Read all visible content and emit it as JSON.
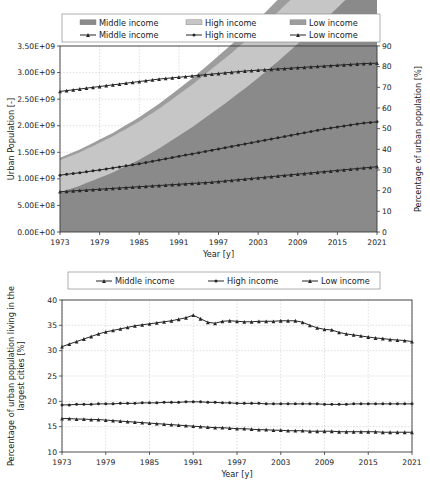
{
  "figure": {
    "width": 430,
    "height": 489,
    "background": "#ffffff"
  },
  "colors": {
    "area_middle": "#8a8a8a",
    "area_high": "#c6c6c6",
    "area_low": "#6e6e6e",
    "line": "#262626",
    "grid": "#c9c9c9",
    "axis": "#3a3a3a"
  },
  "chart_data": [
    {
      "id": "urban-population-stacked",
      "type": "area",
      "title": "",
      "xlabel": "Year [y]",
      "ylabel": "Urban Population [-]",
      "y2label": "Percentage of urban population [%]",
      "xlim": [
        1973,
        2021
      ],
      "ylim": [
        0,
        3500000000
      ],
      "y2lim": [
        0,
        90
      ],
      "grid": true,
      "legend_position": "top",
      "xticks": [
        1973,
        1979,
        1985,
        1991,
        1997,
        2003,
        2009,
        2015,
        2021
      ],
      "xtick_labels": [
        "1973",
        "1979",
        "1985",
        "1991",
        "1997",
        "2003",
        "2009",
        "2015",
        "2021"
      ],
      "yticks": [
        0,
        500000000,
        1000000000,
        1500000000,
        2000000000,
        2500000000,
        3000000000,
        3500000000
      ],
      "ytick_labels": [
        "0.00E+00",
        "5.00E+08",
        "1.00E+09",
        "1.50E+09",
        "2.00E+09",
        "2.50E+09",
        "3.00E+09",
        "3.50E+09"
      ],
      "y2ticks": [
        0,
        10,
        20,
        30,
        40,
        50,
        60,
        70,
        80,
        90
      ],
      "y2tick_labels": [
        "0",
        "10",
        "20",
        "30",
        "40",
        "50",
        "60",
        "70",
        "80",
        "90"
      ],
      "legend": [
        {
          "label": "Middle income",
          "kind": "area",
          "swatch": "#8a8a8a"
        },
        {
          "label": "High income",
          "kind": "area",
          "swatch": "#c6c6c6"
        },
        {
          "label": "Low income",
          "kind": "area",
          "swatch": "#9d9d9d"
        },
        {
          "label": "Middle income",
          "kind": "line",
          "marker": "triangle"
        },
        {
          "label": "High income",
          "kind": "line",
          "marker": "circle"
        },
        {
          "label": "Low income",
          "kind": "line",
          "marker": "triangle"
        }
      ],
      "x": [
        1973,
        1974,
        1975,
        1976,
        1977,
        1978,
        1979,
        1980,
        1981,
        1982,
        1983,
        1984,
        1985,
        1986,
        1987,
        1988,
        1989,
        1990,
        1991,
        1992,
        1993,
        1994,
        1995,
        1996,
        1997,
        1998,
        1999,
        2000,
        2001,
        2002,
        2003,
        2004,
        2005,
        2006,
        2007,
        2008,
        2009,
        2010,
        2011,
        2012,
        2013,
        2014,
        2015,
        2016,
        2017,
        2018,
        2019,
        2020,
        2021
      ],
      "areas": [
        {
          "name": "Middle income",
          "stack_order": 1,
          "color": "#8a8a8a",
          "values": [
            750000000.0,
            790000000.0,
            830000000.0,
            870000000.0,
            920000000.0,
            970000000.0,
            1020000000.0,
            1070000000.0,
            1120000000.0,
            1180000000.0,
            1240000000.0,
            1300000000.0,
            1360000000.0,
            1430000000.0,
            1500000000.0,
            1570000000.0,
            1650000000.0,
            1730000000.0,
            1810000000.0,
            1890000000.0,
            1970000000.0,
            2060000000.0,
            2150000000.0,
            2240000000.0,
            2330000000.0,
            2420000000.0,
            2510000000.0,
            2610000000.0,
            2700000000.0,
            2800000000.0,
            2900000000.0,
            3000000000.0,
            3110000000.0,
            3210000000.0,
            3320000000.0,
            3430000000.0,
            3540000000.0,
            3650000000.0,
            3760000000.0,
            3870000000.0,
            3990000000.0,
            4100000000.0,
            4220000000.0,
            4340000000.0,
            4450000000.0,
            4570000000.0,
            4690000000.0,
            4800000000.0,
            4920000000.0
          ]
        },
        {
          "name": "High income",
          "stack_order": 2,
          "color": "#c6c6c6",
          "values": [
            600000000.0,
            610000000.0,
            620000000.0,
            630000000.0,
            640000000.0,
            650000000.0,
            660000000.0,
            670000000.0,
            680000000.0,
            690000000.0,
            700000000.0,
            710000000.0,
            720000000.0,
            730000000.0,
            740000000.0,
            750000000.0,
            760000000.0,
            770000000.0,
            780000000.0,
            790000000.0,
            800000000.0,
            810000000.0,
            820000000.0,
            830000000.0,
            840000000.0,
            850000000.0,
            860000000.0,
            870000000.0,
            880000000.0,
            890000000.0,
            900000000.0,
            910000000.0,
            920000000.0,
            930000000.0,
            940000000.0,
            950000000.0,
            960000000.0,
            970000000.0,
            980000000.0,
            990000000.0,
            1000000000.0,
            1010000000.0,
            1020000000.0,
            1030000000.0,
            1040000000.0,
            1050000000.0,
            1060000000.0,
            1070000000.0,
            1080000000.0
          ]
        },
        {
          "name": "Low income",
          "stack_order": 3,
          "color": "#9d9d9d",
          "values": [
            45000000.0,
            47000000.0,
            49000000.0,
            51000000.0,
            54000000.0,
            56000000.0,
            59000000.0,
            62000000.0,
            65000000.0,
            68000000.0,
            72000000.0,
            75000000.0,
            79000000.0,
            83000000.0,
            87000000.0,
            92000000.0,
            97000000.0,
            102000000.0,
            107000000.0,
            113000000.0,
            119000000.0,
            125000000.0,
            132000000.0,
            139000000.0,
            146000000.0,
            154000000.0,
            162000000.0,
            170000000.0,
            179000000.0,
            189000000.0,
            199000000.0,
            209000000.0,
            220000000.0,
            232000000.0,
            244000000.0,
            257000000.0,
            270000000.0,
            284000000.0,
            299000000.0,
            315000000.0,
            331000000.0,
            348000000.0,
            366000000.0,
            385000000.0,
            405000000.0,
            426000000.0,
            448000000.0,
            471000000.0,
            495000000.0
          ]
        }
      ],
      "lines_pct": [
        {
          "name": "Low income",
          "marker": "triangle",
          "axis": "right",
          "values": [
            68.0,
            68.4,
            68.8,
            69.2,
            69.6,
            70.0,
            70.4,
            70.8,
            71.2,
            71.6,
            72.0,
            72.4,
            72.8,
            73.2,
            73.6,
            74.0,
            74.3,
            74.6,
            74.9,
            75.2,
            75.5,
            75.8,
            76.1,
            76.4,
            76.7,
            77.0,
            77.3,
            77.6,
            77.9,
            78.1,
            78.3,
            78.5,
            78.7,
            78.9,
            79.1,
            79.3,
            79.5,
            79.7,
            79.9,
            80.1,
            80.3,
            80.5,
            80.7,
            80.9,
            81.1,
            81.3,
            81.5,
            81.6,
            81.7
          ]
        },
        {
          "name": "Middle income",
          "marker": "circle",
          "axis": "right",
          "values": [
            27.5,
            27.9,
            28.3,
            28.7,
            29.1,
            29.6,
            30.0,
            30.5,
            31.0,
            31.5,
            32.0,
            32.5,
            33.0,
            33.6,
            34.2,
            34.8,
            35.4,
            36.0,
            36.6,
            37.2,
            37.8,
            38.4,
            39.0,
            39.6,
            40.2,
            40.8,
            41.4,
            42.0,
            42.6,
            43.2,
            43.8,
            44.4,
            45.0,
            45.6,
            46.2,
            46.8,
            47.4,
            48.0,
            48.6,
            49.2,
            49.8,
            50.3,
            50.8,
            51.3,
            51.8,
            52.3,
            52.7,
            53.0,
            53.3
          ]
        },
        {
          "name": "High income",
          "marker": "triangle",
          "axis": "right",
          "values": [
            19.5,
            19.7,
            19.9,
            20.1,
            20.3,
            20.5,
            20.7,
            20.9,
            21.1,
            21.3,
            21.5,
            21.7,
            21.9,
            22.1,
            22.3,
            22.5,
            22.7,
            22.9,
            23.1,
            23.3,
            23.5,
            23.7,
            23.9,
            24.1,
            24.4,
            24.7,
            25.0,
            25.3,
            25.6,
            25.9,
            26.2,
            26.5,
            26.8,
            27.1,
            27.4,
            27.7,
            28.0,
            28.3,
            28.6,
            28.9,
            29.2,
            29.5,
            29.8,
            30.1,
            30.4,
            30.7,
            31.0,
            31.3,
            31.6
          ]
        }
      ]
    },
    {
      "id": "largest-cities-share",
      "type": "line",
      "title": "",
      "xlabel": "Year [y]",
      "ylabel": "Percentage of urban population living in the largest cities [%]",
      "xlim": [
        1973,
        2021
      ],
      "ylim": [
        10,
        40
      ],
      "grid": true,
      "legend_position": "top",
      "xticks": [
        1973,
        1979,
        1985,
        1991,
        1997,
        2003,
        2009,
        2015,
        2021
      ],
      "xtick_labels": [
        "1973",
        "1979",
        "1985",
        "1991",
        "1997",
        "2003",
        "2009",
        "2015",
        "2021"
      ],
      "yticks": [
        10,
        15,
        20,
        25,
        30,
        35,
        40
      ],
      "ytick_labels": [
        "10",
        "15",
        "20",
        "25",
        "30",
        "35",
        "40"
      ],
      "legend": [
        {
          "label": "Middle income",
          "kind": "line",
          "marker": "triangle"
        },
        {
          "label": "High income",
          "kind": "line",
          "marker": "circle"
        },
        {
          "label": "Low income",
          "kind": "line",
          "marker": "triangle"
        }
      ],
      "x": [
        1973,
        1974,
        1975,
        1976,
        1977,
        1978,
        1979,
        1980,
        1981,
        1982,
        1983,
        1984,
        1985,
        1986,
        1987,
        1988,
        1989,
        1990,
        1991,
        1992,
        1993,
        1994,
        1995,
        1996,
        1997,
        1998,
        1999,
        2000,
        2001,
        2002,
        2003,
        2004,
        2005,
        2006,
        2007,
        2008,
        2009,
        2010,
        2011,
        2012,
        2013,
        2014,
        2015,
        2016,
        2017,
        2018,
        2019,
        2020,
        2021
      ],
      "series": [
        {
          "name": "Low income",
          "marker": "triangle",
          "values": [
            30.8,
            31.3,
            31.8,
            32.3,
            32.8,
            33.3,
            33.7,
            34.0,
            34.3,
            34.6,
            34.9,
            35.1,
            35.3,
            35.5,
            35.7,
            35.9,
            36.2,
            36.5,
            37.0,
            36.3,
            35.6,
            35.4,
            35.8,
            35.9,
            35.8,
            35.7,
            35.7,
            35.8,
            35.8,
            35.8,
            35.9,
            35.9,
            35.9,
            35.6,
            35.0,
            34.5,
            34.2,
            34.1,
            33.6,
            33.3,
            33.1,
            32.9,
            32.7,
            32.5,
            32.4,
            32.2,
            32.1,
            32.0,
            31.8
          ]
        },
        {
          "name": "High income",
          "marker": "circle",
          "values": [
            19.3,
            19.3,
            19.4,
            19.4,
            19.4,
            19.5,
            19.5,
            19.5,
            19.6,
            19.6,
            19.6,
            19.7,
            19.7,
            19.7,
            19.8,
            19.8,
            19.8,
            19.9,
            19.9,
            19.9,
            19.8,
            19.8,
            19.7,
            19.7,
            19.6,
            19.6,
            19.6,
            19.6,
            19.5,
            19.5,
            19.5,
            19.5,
            19.5,
            19.5,
            19.5,
            19.5,
            19.4,
            19.4,
            19.4,
            19.4,
            19.5,
            19.5,
            19.5,
            19.5,
            19.5,
            19.5,
            19.5,
            19.5,
            19.5
          ]
        },
        {
          "name": "Middle income",
          "marker": "triangle",
          "values": [
            16.6,
            16.6,
            16.5,
            16.5,
            16.4,
            16.4,
            16.3,
            16.2,
            16.1,
            16.0,
            15.9,
            15.8,
            15.7,
            15.6,
            15.5,
            15.4,
            15.3,
            15.2,
            15.1,
            15.0,
            14.9,
            14.8,
            14.8,
            14.7,
            14.6,
            14.6,
            14.5,
            14.4,
            14.4,
            14.3,
            14.3,
            14.2,
            14.2,
            14.2,
            14.1,
            14.1,
            14.1,
            14.1,
            14.0,
            14.0,
            14.0,
            14.0,
            14.0,
            14.0,
            13.9,
            13.9,
            13.9,
            13.9,
            13.9
          ]
        }
      ]
    }
  ]
}
